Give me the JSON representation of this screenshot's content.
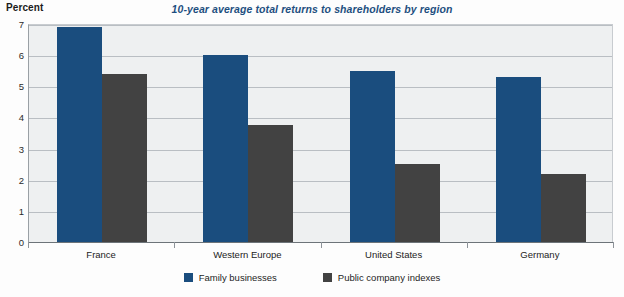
{
  "chart_data": {
    "type": "bar",
    "title": "10-year average total returns to shareholders by region",
    "xlabel": "",
    "ylabel": "Percent",
    "ylim": [
      0,
      7
    ],
    "yticks": [
      0,
      1,
      2,
      3,
      4,
      5,
      6,
      7
    ],
    "ytick_labels": [
      "0",
      "1",
      "2",
      "3",
      "4",
      "5",
      "6",
      "7"
    ],
    "grid": true,
    "grid_axis": "y",
    "legend_position": "bottom-center",
    "categories": [
      "France",
      "Western Europe",
      "United States",
      "Germany"
    ],
    "series": [
      {
        "name": "Family businesses",
        "color": "#1a4d7e",
        "values": [
          6.9,
          6.0,
          5.5,
          5.3
        ]
      },
      {
        "name": "Public company indexes",
        "color": "#424242",
        "values": [
          5.4,
          3.75,
          2.5,
          2.2
        ]
      }
    ]
  },
  "style": {
    "title_color": "#1d4f80",
    "plot_background": "#eef0f1",
    "gridline_color": "#b9bec3",
    "axis_color": "#6d7479",
    "page_background": "#fdfdfd"
  }
}
